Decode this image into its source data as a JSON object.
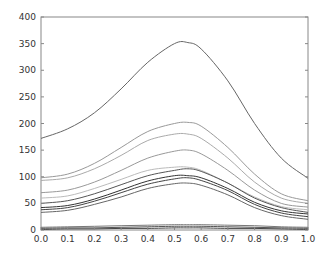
{
  "chart_data": {
    "type": "line",
    "title": "",
    "xlabel": "",
    "ylabel": "",
    "xlim": [
      0.0,
      1.0
    ],
    "ylim": [
      0,
      400
    ],
    "x_ticks": [
      "0.0",
      "0.1",
      "0.2",
      "0.3",
      "0.4",
      "0.5",
      "0.6",
      "0.7",
      "0.8",
      "0.9",
      "1.0"
    ],
    "y_ticks": [
      "0",
      "50",
      "100",
      "150",
      "200",
      "250",
      "300",
      "350",
      "400"
    ],
    "grid": false,
    "legend": null,
    "x": [
      0.0,
      0.1,
      0.2,
      0.3,
      0.4,
      0.5,
      0.55,
      0.6,
      0.7,
      0.8,
      0.9,
      1.0
    ],
    "series": [
      {
        "name": "s1",
        "color": "#666666",
        "values": [
          172,
          190,
          220,
          265,
          315,
          350,
          352,
          340,
          280,
          200,
          135,
          97
        ]
      },
      {
        "name": "s2",
        "color": "#999999",
        "values": [
          98,
          105,
          125,
          155,
          185,
          200,
          202,
          195,
          155,
          105,
          68,
          55
        ]
      },
      {
        "name": "s3",
        "color": "#aaaaaa",
        "values": [
          93,
          98,
          115,
          140,
          168,
          180,
          180,
          172,
          135,
          90,
          60,
          50
        ]
      },
      {
        "name": "s4",
        "color": "#999999",
        "values": [
          70,
          75,
          90,
          112,
          135,
          148,
          150,
          143,
          112,
          75,
          50,
          43
        ]
      },
      {
        "name": "s5",
        "color": "#bbbbbb",
        "values": [
          60,
          64,
          78,
          95,
          112,
          118,
          118,
          112,
          88,
          62,
          44,
          38
        ]
      },
      {
        "name": "s6",
        "color": "#555555",
        "values": [
          50,
          55,
          68,
          85,
          102,
          112,
          115,
          110,
          88,
          60,
          42,
          33
        ]
      },
      {
        "name": "s7",
        "color": "#333333",
        "values": [
          42,
          46,
          58,
          75,
          92,
          102,
          102,
          98,
          78,
          52,
          36,
          30
        ]
      },
      {
        "name": "s8",
        "color": "#444444",
        "values": [
          38,
          42,
          54,
          70,
          86,
          96,
          98,
          93,
          74,
          48,
          32,
          25
        ]
      },
      {
        "name": "s9",
        "color": "#666666",
        "values": [
          33,
          37,
          48,
          62,
          78,
          87,
          88,
          84,
          66,
          42,
          27,
          20
        ]
      },
      {
        "name": "s10",
        "color": "#777777",
        "values": [
          5,
          6,
          7,
          8,
          9,
          10,
          10,
          10,
          9,
          8,
          6,
          5
        ]
      },
      {
        "name": "s11",
        "color": "#555555",
        "values": [
          3,
          4,
          4,
          5,
          6,
          7,
          7,
          7,
          6,
          5,
          4,
          3
        ]
      },
      {
        "name": "s12",
        "color": "#444444",
        "values": [
          1,
          2,
          2,
          3,
          3,
          4,
          4,
          4,
          3,
          3,
          2,
          1
        ]
      }
    ]
  }
}
